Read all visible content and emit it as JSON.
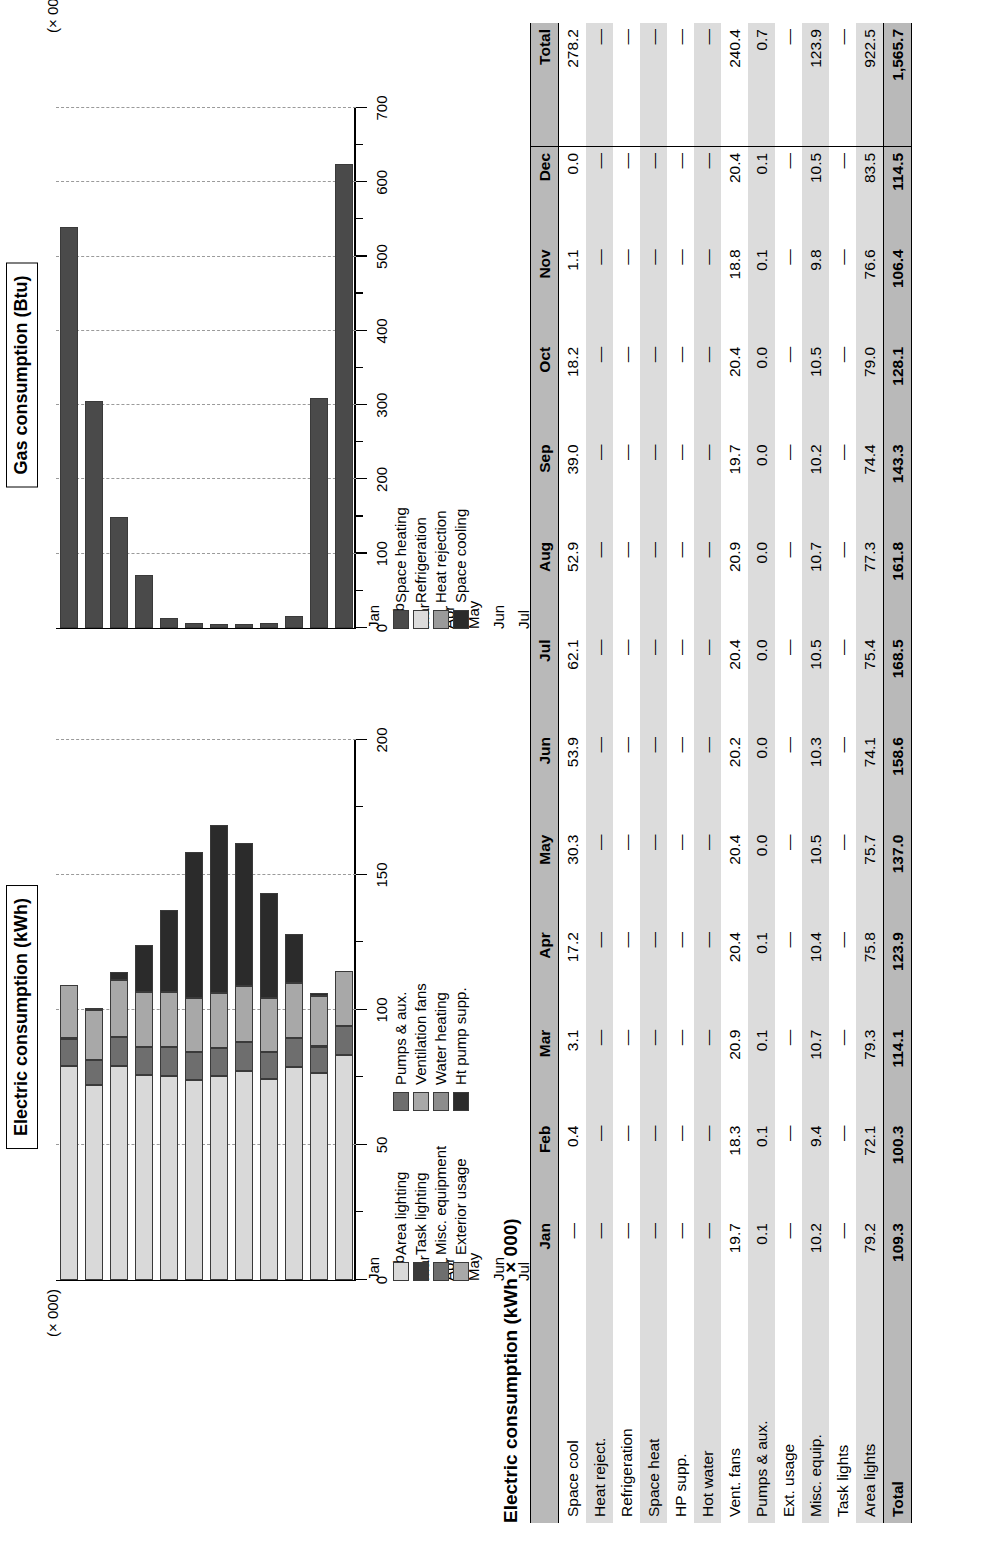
{
  "page": {
    "table_title": "Electric consumption (kWh × 000)"
  },
  "charts": [
    {
      "id": "electric",
      "title": "Electric consumption (kWh)",
      "units_label": "(× 000)"
    },
    {
      "id": "gas",
      "title": "Gas consumption (Btu)",
      "units_label": "(× 000,000)"
    }
  ],
  "chart_data": [
    {
      "type": "bar",
      "subtype": "stacked-horizontal",
      "title": "Electric consumption (kWh)",
      "xlabel": "",
      "ylabel": "(× 000)",
      "categories": [
        "Jan",
        "Feb",
        "Mar",
        "Apr",
        "May",
        "Jun",
        "Jul",
        "Aug",
        "Sep",
        "Oct",
        "Nov",
        "Dec"
      ],
      "ylim": [
        0,
        200
      ],
      "yticks": [
        0,
        50,
        100,
        150,
        200
      ],
      "grid": true,
      "legend_position": "right",
      "series": [
        {
          "name": "Area lighting",
          "color": "#d9d9d9",
          "values": [
            79.2,
            72.1,
            79.3,
            75.8,
            75.7,
            74.1,
            75.4,
            77.3,
            74.4,
            79.0,
            76.6,
            83.5
          ]
        },
        {
          "name": "Task lighting",
          "color": "#3a3a3a",
          "values": [
            0,
            0,
            0,
            0,
            0,
            0,
            0,
            0,
            0,
            0,
            0,
            0
          ]
        },
        {
          "name": "Misc. equipment",
          "color": "#6e6e6e",
          "values": [
            10.2,
            9.4,
            10.7,
            10.4,
            10.5,
            10.3,
            10.5,
            10.7,
            10.2,
            10.5,
            9.8,
            10.5
          ]
        },
        {
          "name": "Exterior usage",
          "color": "#a8a8a8",
          "values": [
            0,
            0,
            0,
            0,
            0,
            0,
            0,
            0,
            0,
            0,
            0,
            0
          ]
        },
        {
          "name": "Pumps & aux.",
          "color": "#6e6e6e",
          "values": [
            0.1,
            0.1,
            0.1,
            0.1,
            0.0,
            0.0,
            0.0,
            0.0,
            0.0,
            0.0,
            0.1,
            0.1
          ]
        },
        {
          "name": "Ventilation fans",
          "color": "#a8a8a8",
          "values": [
            19.7,
            18.3,
            20.9,
            20.4,
            20.4,
            20.2,
            20.4,
            20.9,
            19.7,
            20.4,
            18.8,
            20.4
          ]
        },
        {
          "name": "Water heating",
          "color": "#8c8c8c",
          "values": [
            0,
            0,
            0,
            0,
            0,
            0,
            0,
            0,
            0,
            0,
            0,
            0
          ]
        },
        {
          "name": "Ht pump supp.",
          "color": "#2b2b2b",
          "values": [
            0.0,
            0.4,
            3.1,
            17.2,
            30.3,
            53.9,
            62.1,
            52.9,
            39.0,
            18.2,
            1.1,
            0.0
          ]
        }
      ],
      "legend_left_column": [
        "Area lighting",
        "Task lighting",
        "Misc. equipment",
        "Exterior usage"
      ],
      "legend_right_column": [
        "Pumps & aux.",
        "Ventilation fans",
        "Water heating",
        "Ht pump supp."
      ]
    },
    {
      "type": "bar",
      "subtype": "horizontal",
      "title": "Gas consumption (Btu)",
      "xlabel": "",
      "ylabel": "(× 000,000)",
      "categories": [
        "Jan",
        "Feb",
        "Mar",
        "Apr",
        "May",
        "Jun",
        "Jul",
        "Aug",
        "Sep",
        "Oct",
        "Nov",
        "Dec"
      ],
      "ylim": [
        0,
        700
      ],
      "yticks": [
        0,
        100,
        200,
        300,
        400,
        500,
        600,
        700
      ],
      "grid": true,
      "legend_position": "right",
      "series": [
        {
          "name": "Space heating",
          "color": "#4a4a4a",
          "values": [
            540,
            305,
            150,
            72,
            14,
            7,
            5,
            5,
            7,
            16,
            310,
            625
          ]
        },
        {
          "name": "Refrigeration",
          "color": "#dcdcdc",
          "values": [
            0,
            0,
            0,
            0,
            0,
            0,
            0,
            0,
            0,
            0,
            0,
            0
          ]
        },
        {
          "name": "Heat rejection",
          "color": "#9a9a9a",
          "values": [
            0,
            0,
            0,
            0,
            0,
            0,
            0,
            0,
            0,
            0,
            0,
            0
          ]
        },
        {
          "name": "Space cooling",
          "color": "#2b2b2b",
          "values": [
            0,
            0,
            0,
            0,
            0,
            0,
            0,
            0,
            0,
            0,
            0,
            0
          ]
        }
      ],
      "legend_left_column": [
        "Space heating",
        "Refrigeration",
        "Heat rejection",
        "Space cooling"
      ]
    }
  ],
  "table": {
    "title": "Electric consumption (kWh × 000)",
    "columns": [
      "",
      "Jan",
      "Feb",
      "Mar",
      "Apr",
      "May",
      "Jun",
      "Jul",
      "Aug",
      "Sep",
      "Oct",
      "Nov",
      "Dec",
      "Total"
    ],
    "rows": [
      {
        "label": "Space cool",
        "values": [
          "—",
          "0.4",
          "3.1",
          "17.2",
          "30.3",
          "53.9",
          "62.1",
          "52.9",
          "39.0",
          "18.2",
          "1.1",
          "0.0",
          "278.2"
        ]
      },
      {
        "label": "Heat reject.",
        "values": [
          "—",
          "—",
          "—",
          "—",
          "—",
          "—",
          "—",
          "—",
          "—",
          "—",
          "—",
          "—",
          "—"
        ]
      },
      {
        "label": "Refrigeration",
        "values": [
          "—",
          "—",
          "—",
          "—",
          "—",
          "—",
          "—",
          "—",
          "—",
          "—",
          "—",
          "—",
          "—"
        ]
      },
      {
        "label": "Space heat",
        "values": [
          "—",
          "—",
          "—",
          "—",
          "—",
          "—",
          "—",
          "—",
          "—",
          "—",
          "—",
          "—",
          "—"
        ]
      },
      {
        "label": "HP supp.",
        "values": [
          "—",
          "—",
          "—",
          "—",
          "—",
          "—",
          "—",
          "—",
          "—",
          "—",
          "—",
          "—",
          "—"
        ]
      },
      {
        "label": "Hot water",
        "values": [
          "—",
          "—",
          "—",
          "—",
          "—",
          "—",
          "—",
          "—",
          "—",
          "—",
          "—",
          "—",
          "—"
        ]
      },
      {
        "label": "Vent. fans",
        "values": [
          "19.7",
          "18.3",
          "20.9",
          "20.4",
          "20.4",
          "20.2",
          "20.4",
          "20.9",
          "19.7",
          "20.4",
          "18.8",
          "20.4",
          "240.4"
        ]
      },
      {
        "label": "Pumps & aux.",
        "values": [
          "0.1",
          "0.1",
          "0.1",
          "0.1",
          "0.0",
          "0.0",
          "0.0",
          "0.0",
          "0.0",
          "0.0",
          "0.1",
          "0.1",
          "0.7"
        ]
      },
      {
        "label": "Ext. usage",
        "values": [
          "—",
          "—",
          "—",
          "—",
          "—",
          "—",
          "—",
          "—",
          "—",
          "—",
          "—",
          "—",
          "—"
        ]
      },
      {
        "label": "Misc. equip.",
        "values": [
          "10.2",
          "9.4",
          "10.7",
          "10.4",
          "10.5",
          "10.3",
          "10.5",
          "10.7",
          "10.2",
          "10.5",
          "9.8",
          "10.5",
          "123.9"
        ]
      },
      {
        "label": "Task lights",
        "values": [
          "—",
          "—",
          "—",
          "—",
          "—",
          "—",
          "—",
          "—",
          "—",
          "—",
          "—",
          "—",
          "—"
        ]
      },
      {
        "label": "Area lights",
        "values": [
          "79.2",
          "72.1",
          "79.3",
          "75.8",
          "75.7",
          "74.1",
          "75.4",
          "77.3",
          "74.4",
          "79.0",
          "76.6",
          "83.5",
          "922.5"
        ]
      }
    ],
    "total_row": {
      "label": "Total",
      "values": [
        "109.3",
        "100.3",
        "114.1",
        "123.9",
        "137.0",
        "158.6",
        "168.5",
        "161.8",
        "143.3",
        "128.1",
        "106.4",
        "114.5",
        "1,565.7"
      ]
    }
  }
}
